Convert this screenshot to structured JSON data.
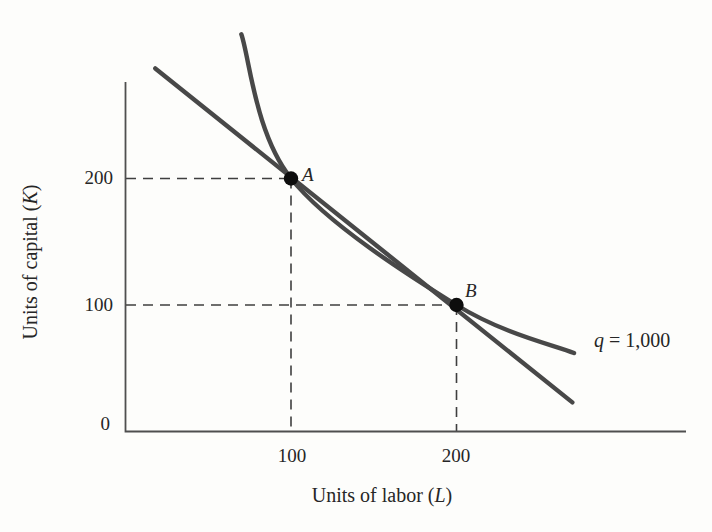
{
  "chart_data": {
    "type": "line",
    "title": "",
    "grid": false,
    "xlabel": {
      "text": "Units of labor (L)",
      "prefix": "Units of labor (",
      "var": "L",
      "suffix": ")"
    },
    "ylabel": {
      "text": "Units of capital (K)",
      "prefix": "Units of capital (",
      "var": "K",
      "suffix": ")"
    },
    "x_ticks": [
      {
        "value": 100,
        "label": "100"
      },
      {
        "value": 200,
        "label": "200"
      }
    ],
    "y_ticks": [
      {
        "value": 0,
        "label": "0"
      },
      {
        "value": 100,
        "label": "100"
      },
      {
        "value": 200,
        "label": "200"
      }
    ],
    "xlim": [
      0,
      339
    ],
    "ylim": [
      0,
      276
    ],
    "series": [
      {
        "name": "isoquant",
        "style": "curve",
        "label": {
          "text": "q = 1,000",
          "var": "q",
          "rest": " = 1,000"
        },
        "points_LK": [
          [
            70,
            314
          ],
          [
            100,
            200
          ],
          [
            200,
            100
          ],
          [
            271,
            62
          ]
        ]
      },
      {
        "name": "isocost-line",
        "style": "straight",
        "points_LK": [
          [
            18,
            287
          ],
          [
            270,
            23
          ]
        ]
      }
    ],
    "marked_points": [
      {
        "label": "A",
        "L": 100,
        "K": 200
      },
      {
        "label": "B",
        "L": 200,
        "K": 100
      }
    ],
    "colors": {
      "line": "#484848",
      "axis": "#4f4f4f",
      "dashed": "#3f3f3f",
      "point": "#0d0d0d",
      "text": "#262626",
      "background": "#fdfdfb"
    }
  }
}
